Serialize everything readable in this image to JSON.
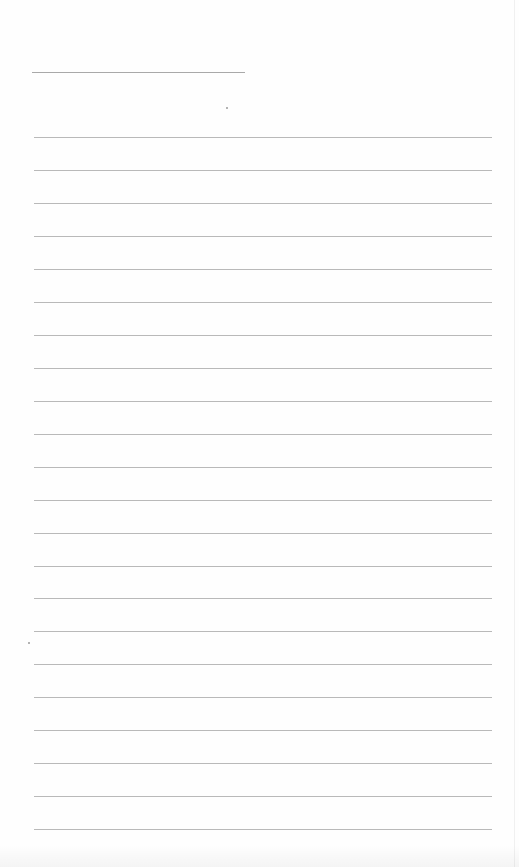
{
  "page": {
    "type": "blank-lined-page",
    "title_line": {
      "text": ""
    },
    "rules": [
      {
        "y": 137
      },
      {
        "y": 170
      },
      {
        "y": 203
      },
      {
        "y": 236
      },
      {
        "y": 269
      },
      {
        "y": 302
      },
      {
        "y": 335
      },
      {
        "y": 368
      },
      {
        "y": 401
      },
      {
        "y": 434
      },
      {
        "y": 467
      },
      {
        "y": 500
      },
      {
        "y": 533
      },
      {
        "y": 566
      },
      {
        "y": 598
      },
      {
        "y": 631
      },
      {
        "y": 664
      },
      {
        "y": 697
      },
      {
        "y": 730
      },
      {
        "y": 763
      },
      {
        "y": 796
      },
      {
        "y": 829
      }
    ],
    "line_color": "#b9b9b9",
    "background_color": "#fefefe"
  }
}
